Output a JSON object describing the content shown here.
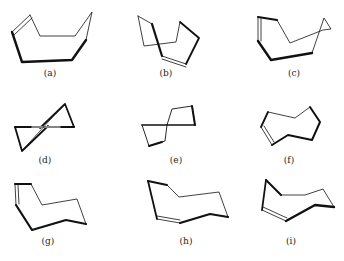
{
  "figure": {
    "panels": [
      {
        "id": "a",
        "label": "(a)",
        "label_x": 50,
        "label_y": 74
      },
      {
        "id": "b",
        "label": "(b)",
        "label_x": 166,
        "label_y": 74
      },
      {
        "id": "c",
        "label": "(c)",
        "label_x": 294,
        "label_y": 74
      },
      {
        "id": "d",
        "label": "(d)",
        "label_x": 45,
        "label_y": 160
      },
      {
        "id": "e",
        "label": "(e)",
        "label_x": 176,
        "label_y": 160
      },
      {
        "id": "f",
        "label": "(f)",
        "label_x": 289,
        "label_y": 160
      },
      {
        "id": "g",
        "label": "(g)",
        "label_x": 48,
        "label_y": 240
      },
      {
        "id": "h",
        "label": "(h)",
        "label_x": 186,
        "label_y": 240
      },
      {
        "id": "i",
        "label": "(i)",
        "label_x": 291,
        "label_y": 240
      }
    ]
  }
}
